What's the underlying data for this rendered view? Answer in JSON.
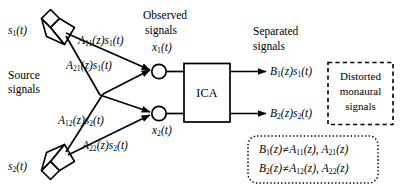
{
  "figure": {
    "type": "block-diagram"
  },
  "sources": {
    "group_label_line1": "Source",
    "group_label_line2": "signals",
    "items": [
      {
        "id": "s1",
        "label": "s",
        "sub": "1",
        "arg": "(t)"
      },
      {
        "id": "s2",
        "label": "s",
        "sub": "2",
        "arg": "(t)"
      }
    ]
  },
  "mixing_paths": [
    {
      "id": "a11",
      "A": "A",
      "A_sub": "11",
      "z": "(z)",
      "s": "s",
      "s_sub": "1",
      "t": "(t)"
    },
    {
      "id": "a21",
      "A": "A",
      "A_sub": "21",
      "z": "(z)",
      "s": "s",
      "s_sub": "1",
      "t": "(t)"
    },
    {
      "id": "a12",
      "A": "A",
      "A_sub": "12",
      "z": "(z)",
      "s": "s",
      "s_sub": "2",
      "t": "(t)"
    },
    {
      "id": "a22",
      "A": "A",
      "A_sub": "22",
      "z": "(z)",
      "s": "s",
      "s_sub": "2",
      "t": "(t)"
    }
  ],
  "observed": {
    "group_label_line1": "Observed",
    "group_label_line2": "signals",
    "items": [
      {
        "id": "x1",
        "label": "x",
        "sub": "1",
        "arg": "(t)"
      },
      {
        "id": "x2",
        "label": "x",
        "sub": "2",
        "arg": "(t)"
      }
    ]
  },
  "processor": {
    "label": "ICA"
  },
  "separated": {
    "group_label_line1": "Separated",
    "group_label_line2": "signals",
    "items": [
      {
        "id": "b1",
        "B": "B",
        "B_sub": "1",
        "z": "(z)",
        "s": "s",
        "s_sub": "1",
        "t": "(t)"
      },
      {
        "id": "b2",
        "B": "B",
        "B_sub": "2",
        "z": "(z)",
        "s": "s",
        "s_sub": "2",
        "t": "(t)"
      }
    ]
  },
  "annotations": {
    "distorted_note": {
      "line1": "Distorted",
      "line2": "monaural",
      "line3": "signals",
      "border_style": "dashed"
    },
    "inequality_note": {
      "border_style": "dotted",
      "line1": {
        "B": "B",
        "B_sub": "1",
        "z1": "(z)",
        "rel": "≠",
        "A1": "A",
        "A1_sub": "11",
        "z2": "(z)",
        "sep": ", ",
        "A2": "A",
        "A2_sub": "21",
        "z3": "(z)"
      },
      "line2": {
        "B": "B",
        "B_sub": "2",
        "z1": "(z)",
        "rel": "≠",
        "A1": "A",
        "A1_sub": "12",
        "z2": "(z)",
        "sep": ", ",
        "A2": "A",
        "A2_sub": "22",
        "z3": "(z)"
      }
    }
  },
  "colors": {
    "stroke": "#000000",
    "background": "#ffffff"
  }
}
